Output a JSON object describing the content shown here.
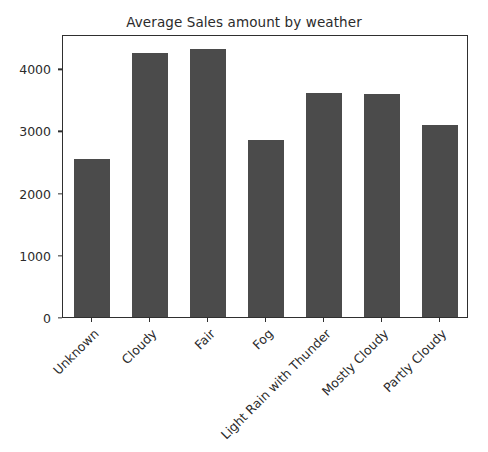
{
  "chart_data": {
    "type": "bar",
    "title": "Average Sales amount by weather",
    "xlabel": "",
    "ylabel": "",
    "categories": [
      "Unknown",
      "Cloudy",
      "Fair",
      "Fog",
      "Light Rain with Thunder",
      "Mostly Cloudy",
      "Partly Cloudy"
    ],
    "values": [
      2540,
      4250,
      4310,
      2850,
      3600,
      3580,
      3090
    ],
    "ylim": [
      0,
      4550
    ],
    "yticks": [
      0,
      1000,
      2000,
      3000,
      4000
    ],
    "ytick_labels": [
      "0",
      "1000",
      "2000",
      "3000",
      "4000"
    ],
    "grid": false,
    "legend": null,
    "bar_color": "#4b4b4b",
    "axis_color": "#2f2f2f",
    "background_color": "#ffffff",
    "xtick_rotation": -45
  }
}
